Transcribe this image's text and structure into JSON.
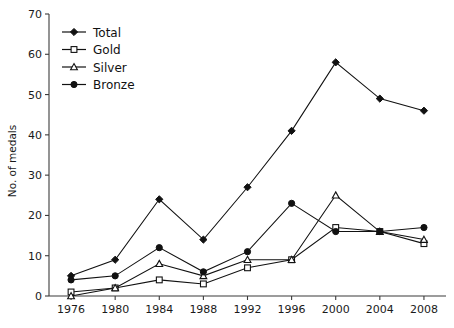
{
  "chart_data": {
    "type": "line",
    "title": "",
    "xlabel": "",
    "ylabel": "No. of medals",
    "categories": [
      "1976",
      "1980",
      "1984",
      "1988",
      "1992",
      "1996",
      "2000",
      "2004",
      "2008"
    ],
    "x": [
      1976,
      1980,
      1984,
      1988,
      1992,
      1996,
      2000,
      2004,
      2008
    ],
    "xlim": [
      1974,
      2010
    ],
    "ylim": [
      0,
      70
    ],
    "yticks": [
      0,
      10,
      20,
      30,
      40,
      50,
      60,
      70
    ],
    "ytick_labels": [
      "0",
      "10",
      "20",
      "30",
      "40",
      "50",
      "60",
      "70"
    ],
    "grid": false,
    "legend_position": "top-left",
    "series": [
      {
        "name": "Total",
        "marker": "filled-diamond",
        "values": [
          5,
          9,
          24,
          14,
          27,
          41,
          58,
          49,
          46
        ]
      },
      {
        "name": "Gold",
        "marker": "open-square",
        "values": [
          1,
          2,
          4,
          3,
          7,
          9,
          17,
          16,
          13
        ]
      },
      {
        "name": "Silver",
        "marker": "open-triangle",
        "values": [
          0,
          2,
          8,
          5,
          9,
          9,
          25,
          16,
          14
        ]
      },
      {
        "name": "Bronze",
        "marker": "filled-circle",
        "values": [
          4,
          5,
          12,
          6,
          11,
          23,
          16,
          16,
          17
        ]
      }
    ],
    "colors": {
      "line": "#111111",
      "axis": "#3b3b3b",
      "marker_fill": "#111111",
      "marker_open_fill": "#ffffff"
    }
  },
  "legend": {
    "items": [
      {
        "label": "Total"
      },
      {
        "label": "Gold"
      },
      {
        "label": "Silver"
      },
      {
        "label": "Bronze"
      }
    ]
  },
  "axes": {
    "y_axis_title": "No. of medals"
  }
}
